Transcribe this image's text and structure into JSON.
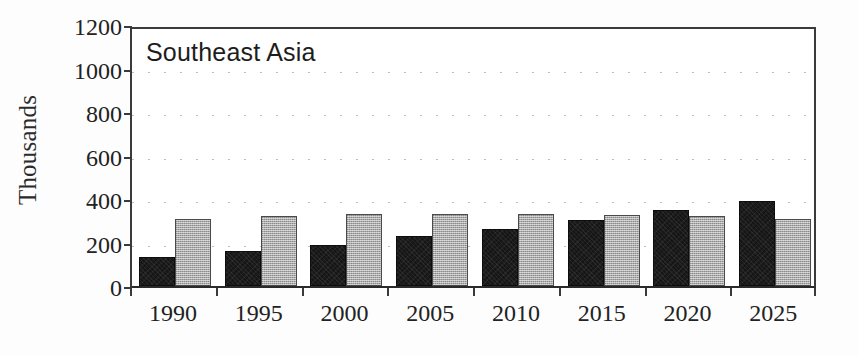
{
  "chart_data": {
    "type": "bar",
    "title": "Southeast Asia",
    "xlabel": "",
    "ylabel": "Thousands",
    "categories": [
      "1990",
      "1995",
      "2000",
      "2005",
      "2010",
      "2015",
      "2020",
      "2025"
    ],
    "series": [
      {
        "name": "dark-series",
        "color": "#161616",
        "values": [
          135,
          160,
          190,
          230,
          260,
          305,
          350,
          390
        ]
      },
      {
        "name": "light-series",
        "color": "#ababab",
        "values": [
          310,
          320,
          330,
          332,
          332,
          325,
          320,
          310
        ]
      }
    ],
    "ylim": [
      0,
      1200
    ],
    "yticks": [
      0,
      200,
      400,
      600,
      800,
      1000,
      1200
    ],
    "ytick_labels": [
      "0",
      "200",
      "400",
      "600",
      "800",
      "1000",
      "1200"
    ],
    "grid": true,
    "grid_style": "dotted-horizontal",
    "legend": "none",
    "legend_position": "none"
  }
}
